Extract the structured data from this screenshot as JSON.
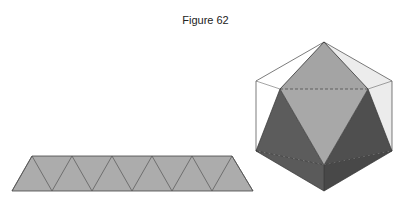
{
  "figure": {
    "title": "Figure 62",
    "net": {
      "description": "Strip of ten equilateral triangles forming the antiprism band (net)",
      "fill": "#acacac",
      "top_points_x": [
        32,
        72,
        112,
        152,
        192,
        232
      ],
      "bottom_points_x": [
        12,
        52,
        92,
        132,
        172,
        212,
        252
      ],
      "top_y": 156,
      "bottom_y": 191
    },
    "solid": {
      "description": "Icosahedron-like solid inscribed in hexagonal prism outline",
      "colors": {
        "light_face": "#a9a9a9",
        "dark_face": "#5a5a5a",
        "darker_face": "#4e4e4e",
        "side_panel": "#ececec",
        "outline": "#333333"
      }
    }
  }
}
